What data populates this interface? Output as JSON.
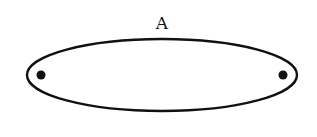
{
  "diagram": {
    "label": "A",
    "colors": {
      "stroke": "#111111",
      "fill": "#ffffff",
      "dot": "#111111"
    },
    "ellipse": {
      "cx": 162,
      "cy": 75,
      "rx": 135,
      "ry": 36
    },
    "points": [
      {
        "name": "left-point",
        "cx": 41,
        "cy": 75
      },
      {
        "name": "right-point",
        "cx": 283,
        "cy": 75
      }
    ]
  }
}
